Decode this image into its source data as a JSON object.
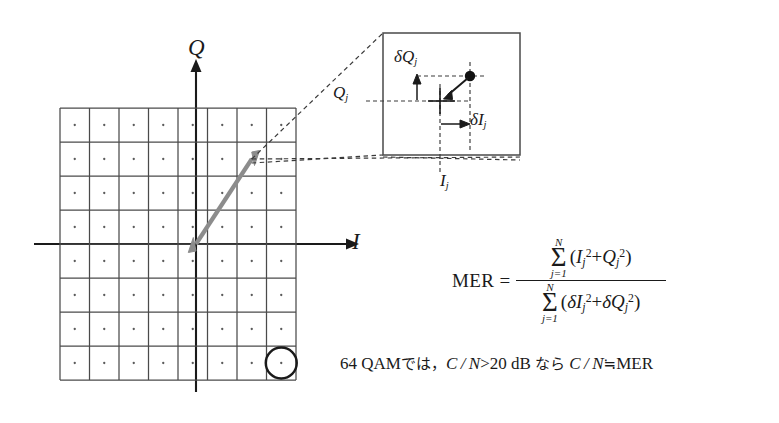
{
  "figure": {
    "axes": {
      "q_label": "Q",
      "i_label": "I"
    },
    "constellation": {
      "type": "qam-grid",
      "order": 64,
      "rows": 8,
      "cols": 8,
      "marked_cell": {
        "row": 7,
        "col": 7,
        "marker": "circle"
      },
      "vector_arrow": {
        "style": "double-headed",
        "color": "#8c8c8c",
        "from_cell": {
          "i": 0,
          "q": 0
        },
        "to_cell": {
          "i": 3,
          "q": 2
        }
      },
      "callout_cell": {
        "i": 3,
        "q": 2
      }
    },
    "inset": {
      "delta_q_label": "δQ",
      "delta_q_sub": "j",
      "delta_i_label": "δI",
      "delta_i_sub": "j",
      "q_ref_label": "Q",
      "q_ref_sub": "j",
      "i_ref_label": "I",
      "i_ref_sub": "j",
      "point_marker": "measured-symbol-dot",
      "ideal_marker": "ideal-symbol-cross"
    },
    "formula": {
      "name": "MER",
      "equals": "=",
      "numerator": {
        "sigma_top": "N",
        "sigma_bottom": "j=1",
        "body_open": "(",
        "term1_base": "I",
        "term1_sub": "j",
        "term1_sup": "2",
        "plus": "+",
        "term2_base": "Q",
        "term2_sub": "j",
        "term2_sup": "2",
        "body_close": ")"
      },
      "denominator": {
        "sigma_top": "N",
        "sigma_bottom": "j=1",
        "body_open": "(",
        "term1_base": "δI",
        "term1_sub": "j",
        "term1_sup": "2",
        "plus": "+",
        "term2_base": "δQ",
        "term2_sub": "j",
        "term2_sup": "2",
        "body_close": ")"
      }
    },
    "note": {
      "prefix": "64 QAM",
      "jp1": "では，",
      "cond": "C / N",
      "gt": ">",
      "value": "20",
      "unit": "dB",
      "jp2": "なら",
      "cond2": "C / N",
      "approx": "≒",
      "result": "MER"
    },
    "colors": {
      "ink": "#1a1a1a",
      "grid": "#4a4a4a",
      "arrow": "#8c8c8c",
      "dash": "#3a3a3a",
      "background": "#ffffff"
    }
  }
}
